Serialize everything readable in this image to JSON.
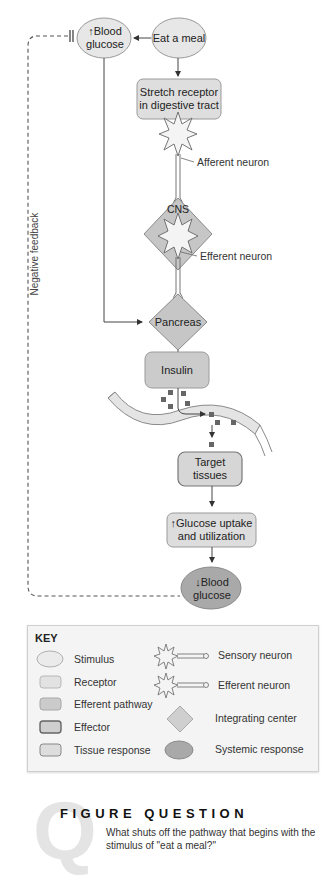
{
  "diagram": {
    "nodes": {
      "blood_glucose_up": {
        "arrow": "↑",
        "line1": "Blood",
        "line2": "glucose",
        "type": "stimulus"
      },
      "eat_meal": {
        "label": "Eat a meal",
        "type": "stimulus"
      },
      "stretch_receptor": {
        "line1": "Stretch receptor",
        "line2": "in digestive tract",
        "type": "receptor"
      },
      "cns": {
        "label": "CNS",
        "type": "integrating-center"
      },
      "pancreas": {
        "label": "Pancreas",
        "type": "integrating-center"
      },
      "insulin": {
        "label": "Insulin",
        "type": "efferent-pathway"
      },
      "target_tissues": {
        "line1": "Target",
        "line2": "tissues",
        "type": "effector"
      },
      "glucose_uptake": {
        "arrow": "↑",
        "line1": "Glucose uptake",
        "line2": "and utilization",
        "type": "tissue-response"
      },
      "blood_glucose_down": {
        "arrow": "↓",
        "line1": "Blood",
        "line2": "glucose",
        "type": "systemic-response"
      }
    },
    "labels": {
      "afferent": "Afferent neuron",
      "efferent": "Efferent neuron",
      "negative_feedback": "Negative feedback"
    },
    "colors": {
      "stimulus": "#e6e6e6",
      "receptor": "#dedede",
      "efferent_pathway": "#cbcbcb",
      "integrating_center": "#c2c2c2",
      "systemic_response": "#a9a9a9",
      "tissue_response": "#dcdcdc",
      "effector": "#d6d6d6",
      "stroke": "#8a8a8a"
    }
  },
  "key": {
    "title": "KEY",
    "left": [
      {
        "label": "Stimulus",
        "shape": "ellipse"
      },
      {
        "label": "Receptor",
        "shape": "rounded-rect-light"
      },
      {
        "label": "Efferent pathway",
        "shape": "rounded-rect-medium"
      },
      {
        "label": "Effector",
        "shape": "rounded-rect-dark-border"
      },
      {
        "label": "Tissue response",
        "shape": "rounded-rect-outline"
      }
    ],
    "right": [
      {
        "label": "Sensory neuron",
        "shape": "neuron"
      },
      {
        "label": "Efferent neuron",
        "shape": "neuron"
      },
      {
        "label": "Integrating center",
        "shape": "diamond"
      },
      {
        "label": "Systemic response",
        "shape": "ellipse-dark"
      }
    ]
  },
  "figure_question": {
    "icon_letter": "Q",
    "title": "FIGURE QUESTION",
    "text": "What shuts off the pathway that  begins with the stimulus of \"eat a meal?\""
  }
}
